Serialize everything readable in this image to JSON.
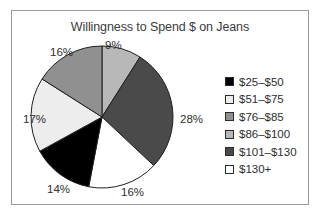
{
  "chart_data": {
    "type": "pie",
    "title": "Willingness to Spend $ on Jeans",
    "xlabel": "",
    "ylabel": "",
    "legend_position": "right",
    "grid": false,
    "categories": [
      "$25–$50",
      "$51–$75",
      "$76–$85",
      "$86–$100",
      "$101–$130",
      "$130+"
    ],
    "values": [
      14,
      17,
      16,
      9,
      28,
      16
    ],
    "value_labels": [
      "14%",
      "17%",
      "16%",
      "9%",
      "28%",
      "16%"
    ],
    "colors": [
      "#000000",
      "#ededed",
      "#909090",
      "#b8b8b8",
      "#4a4a4a",
      "#ffffff"
    ],
    "slice_order_clockwise_from_top": [
      {
        "label": "9%",
        "value": 9,
        "category": "$86–$100",
        "color": "#b8b8b8"
      },
      {
        "label": "28%",
        "value": 28,
        "category": "$101–$130",
        "color": "#4a4a4a"
      },
      {
        "label": "16%",
        "value": 16,
        "category": "$130+",
        "color": "#ffffff"
      },
      {
        "label": "14%",
        "value": 14,
        "category": "$25–$50",
        "color": "#000000"
      },
      {
        "label": "17%",
        "value": 17,
        "category": "$51–$75",
        "color": "#ededed"
      },
      {
        "label": "16%",
        "value": 16,
        "category": "$76–$85",
        "color": "#909090"
      }
    ]
  },
  "chart": {
    "title": "Willingness to Spend $ on Jeans",
    "labels": {
      "top": "9%",
      "right": "28%",
      "bottom_right": "16%",
      "bottom_left": "14%",
      "left": "17%",
      "top_left": "16%"
    }
  },
  "legend": {
    "items": [
      {
        "label": "$25–$50",
        "color": "#000000"
      },
      {
        "label": "$51–$75",
        "color": "#ededed"
      },
      {
        "label": "$76–$85",
        "color": "#909090"
      },
      {
        "label": "$86–$100",
        "color": "#b8b8b8"
      },
      {
        "label": "$101–$130",
        "color": "#4a4a4a"
      },
      {
        "label": "$130+",
        "color": "#ffffff"
      }
    ]
  }
}
